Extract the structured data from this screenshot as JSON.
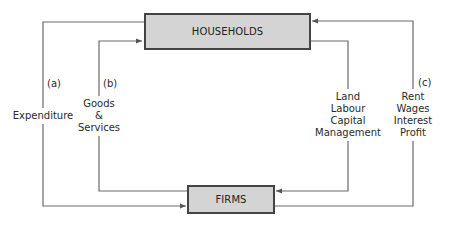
{
  "diagram": {
    "type": "circular-flow",
    "nodes": {
      "households": "HOUSEHOLDS",
      "firms": "FIRMS"
    },
    "flows": [
      {
        "id": "a",
        "tag": "(a)",
        "label_lines": [
          "Expenditure"
        ],
        "from": "households",
        "to": "firms",
        "side": "left-outer"
      },
      {
        "id": "b",
        "tag": "(b)",
        "label_lines": [
          "Goods",
          "&",
          "Services"
        ],
        "from": "firms",
        "to": "households",
        "side": "left-inner"
      },
      {
        "id": "factors",
        "tag": "",
        "label_lines": [
          "Land",
          "Labour",
          "Capital",
          "Management"
        ],
        "from": "households",
        "to": "firms",
        "side": "right-inner"
      },
      {
        "id": "c",
        "tag": "(c)",
        "label_lines": [
          "Rent",
          "Wages",
          "Interest",
          "Profit"
        ],
        "from": "firms",
        "to": "households",
        "side": "right-outer"
      }
    ],
    "colors": {
      "box_fill": "#d4d4d4",
      "box_border": "#444444",
      "line": "#666666"
    }
  }
}
